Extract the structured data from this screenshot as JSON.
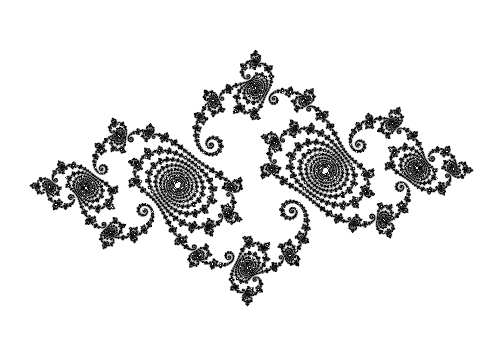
{
  "image": {
    "subject": "Julia set fractal",
    "width": 502,
    "height": 355,
    "colors": {
      "background": "#ffffff",
      "ink": "#000000"
    }
  },
  "fractal": {
    "c_re": -0.75,
    "c_im": 0.1,
    "center_x": 0.0,
    "center_y": 0.0,
    "view_width": 3.4,
    "max_iter": 400,
    "de_threshold": 0.0035
  }
}
